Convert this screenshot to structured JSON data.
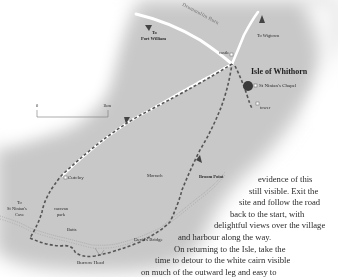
{
  "map": {
    "title": "Isle of Whithorn",
    "labels": {
      "to_port_william": "To\nPort William",
      "to_port_william_l1": "To",
      "to_port_william_l2": "Port William",
      "drummullin_burn": "Drummullin Burn",
      "to_wigtown": "To Wigtown",
      "castle": "castle",
      "isle_of_whithorn": "Isle of Whithorn",
      "st_ninians_chapel": "St Ninian's Chapel",
      "tower": "tower",
      "cutcloy": "Cutcloy",
      "morrach": "Morrach",
      "broom_point": "Broom Point",
      "to_st_ninians_cave_l1": "To",
      "to_st_ninians_cave_l2": "St Ninian's",
      "to_st_ninians_cave_l3": "Cave",
      "caravan_park_l1": "caravan",
      "caravan_park_l2": "park",
      "butts": "Butts",
      "devils_bridge": "Devil's Bridge",
      "burrow_head": "Burrow Head"
    },
    "scale_bar": {
      "start_label": "0",
      "end_label": "1km"
    },
    "colors": {
      "land": "#c9c9c9",
      "road": "#ffffff",
      "route": "#555555",
      "village": "#3a3a3a",
      "text": "#2b2b2b"
    }
  },
  "text": {
    "lines": [
      "evidence of this",
      "still visible. Exit the",
      "site and follow the road",
      "back to the start, with",
      "delightful views over the village",
      "and harbour along the way.",
      "On returning to the Isle, take the",
      "time to detour to the white cairn visible",
      "on much of the outward leg and easy to"
    ]
  }
}
